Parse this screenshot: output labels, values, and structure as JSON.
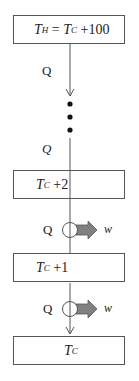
{
  "diagram": {
    "top_box": {
      "var": "T",
      "sub": "H",
      "eq": " = ",
      "var2": "T",
      "sub2": "C",
      "rest": " +100"
    },
    "q_top": "Q",
    "q_middle": "Q",
    "box_tc2": {
      "var": "T",
      "sub": "C",
      "rest": " +2"
    },
    "engine1": {
      "q": "Q",
      "w": "w"
    },
    "box_tc1": {
      "var": "T",
      "sub": "C",
      "rest": " +1"
    },
    "engine2": {
      "q": "Q",
      "w": "w"
    },
    "bottom_box": {
      "var": "T",
      "sub": "C"
    },
    "colors": {
      "line": "#555555",
      "arrow_fill": "#808080",
      "dot": "#111111"
    }
  }
}
